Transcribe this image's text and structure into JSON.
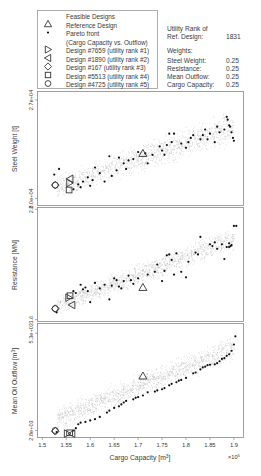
{
  "legend": {
    "items": [
      {
        "marker": "dot-gray",
        "label": "Feasible Designs"
      },
      {
        "marker": "triangle-up",
        "label": "Reference Design"
      },
      {
        "marker": "dot-black",
        "label": "Pareto front"
      },
      {
        "marker": "none",
        "label": "(Cargo Capacity vs. Outflow)"
      },
      {
        "marker": "triangle-right",
        "label": "Design #7659 (utility rank #1)"
      },
      {
        "marker": "triangle-left",
        "label": "Design #1890 (utility rank #2)"
      },
      {
        "marker": "diamond",
        "label": "Design #167 (utility rank #3)"
      },
      {
        "marker": "square",
        "label": "Design #5513 (utility rank #4)"
      },
      {
        "marker": "circle",
        "label": "Design #4725 (utility rank #5)"
      }
    ]
  },
  "info": {
    "utility_label_1": "Utility Rank of",
    "utility_label_2": "Ref. Design:",
    "utility_value": "1831",
    "weights_title": "Weights:",
    "weights": [
      {
        "name": "Steel Weight:",
        "value": "0.25"
      },
      {
        "name": "Resistance:",
        "value": "0.25"
      },
      {
        "name": "Mean Outflow:",
        "value": "0.25"
      },
      {
        "name": "Cargo Capacity:",
        "value": "0.25"
      }
    ]
  },
  "colors": {
    "feasible": "#9a9a9a",
    "pareto": "#111111",
    "frame": "#888888",
    "text": "#3a3a3a"
  },
  "chart_data": [
    {
      "type": "scatter",
      "title": "",
      "xlabel": "",
      "ylabel": "Steel Weight [t]",
      "yticks": [
        {
          "value": 20000,
          "label": "2.0e+04"
        },
        {
          "value": 27000,
          "label": "2.7e+04"
        }
      ],
      "xlim": [
        1.49,
        1.92
      ],
      "ylim": [
        19500,
        27600
      ],
      "band": {
        "x0": 1.53,
        "y0_lo": 19800,
        "y0_hi": 21800,
        "x1": 1.9,
        "y1_lo": 23600,
        "y1_hi": 26600
      },
      "reference": {
        "x": 1.71,
        "y": 23200
      },
      "designs": [
        {
          "id": 7659,
          "marker": "triangle-right",
          "x": 1.557,
          "y": 21100
        },
        {
          "id": 1890,
          "marker": "triangle-left",
          "x": 1.558,
          "y": 21400
        },
        {
          "id": 167,
          "marker": "diamond",
          "x": 1.527,
          "y": 20950
        },
        {
          "id": 5513,
          "marker": "square",
          "x": 1.556,
          "y": 20600
        },
        {
          "id": 4725,
          "marker": "circle",
          "x": 1.527,
          "y": 20950
        }
      ],
      "pareto": [
        [
          1.525,
          21700
        ],
        [
          1.535,
          22100
        ],
        [
          1.565,
          20650
        ],
        [
          1.575,
          21000
        ],
        [
          1.58,
          20800
        ],
        [
          1.585,
          21200
        ],
        [
          1.595,
          21500
        ],
        [
          1.6,
          20900
        ],
        [
          1.605,
          21300
        ],
        [
          1.61,
          22200
        ],
        [
          1.62,
          21800
        ],
        [
          1.63,
          21200
        ],
        [
          1.64,
          23000
        ],
        [
          1.645,
          21600
        ],
        [
          1.655,
          22000
        ],
        [
          1.66,
          22900
        ],
        [
          1.67,
          22500
        ],
        [
          1.675,
          22100
        ],
        [
          1.68,
          22700
        ],
        [
          1.69,
          22800
        ],
        [
          1.7,
          23300
        ],
        [
          1.715,
          23200
        ],
        [
          1.72,
          22500
        ],
        [
          1.73,
          23100
        ],
        [
          1.745,
          23700
        ],
        [
          1.75,
          23400
        ],
        [
          1.755,
          23100
        ],
        [
          1.76,
          23800
        ],
        [
          1.765,
          24600
        ],
        [
          1.77,
          24000
        ],
        [
          1.775,
          24600
        ],
        [
          1.79,
          23900
        ],
        [
          1.8,
          23600
        ],
        [
          1.805,
          24000
        ],
        [
          1.81,
          24300
        ],
        [
          1.815,
          24500
        ],
        [
          1.83,
          24200
        ],
        [
          1.835,
          24500
        ],
        [
          1.84,
          24900
        ],
        [
          1.845,
          24200
        ],
        [
          1.85,
          24600
        ],
        [
          1.86,
          24000
        ],
        [
          1.865,
          25100
        ],
        [
          1.87,
          24700
        ],
        [
          1.88,
          24900
        ],
        [
          1.885,
          25800
        ],
        [
          1.887,
          25600
        ],
        [
          1.89,
          25200
        ],
        [
          1.892,
          25100
        ],
        [
          1.895,
          24700
        ],
        [
          1.898,
          24300
        ],
        [
          1.9,
          24100
        ]
      ]
    },
    {
      "type": "scatter",
      "title": "",
      "xlabel": "",
      "ylabel": "Resistance [MN]",
      "yticks": [
        {
          "value": 1.6,
          "label": "1.6"
        },
        {
          "value": 2.8,
          "label": "2.8"
        }
      ],
      "xlim": [
        1.49,
        1.92
      ],
      "ylim": [
        1.58,
        2.82
      ],
      "band": {
        "x0": 1.53,
        "y0_lo": 1.62,
        "y0_hi": 1.88,
        "x1": 1.9,
        "y1_lo": 2.32,
        "y1_hi": 2.66
      },
      "reference": {
        "x": 1.71,
        "y": 1.95
      },
      "designs": [
        {
          "id": 7659,
          "marker": "triangle-right",
          "x": 1.555,
          "y": 1.84
        },
        {
          "id": 1890,
          "marker": "triangle-left",
          "x": 1.562,
          "y": 1.76
        },
        {
          "id": 167,
          "marker": "diamond",
          "x": 1.527,
          "y": 1.72
        },
        {
          "id": 5513,
          "marker": "square",
          "x": 1.558,
          "y": 1.86
        },
        {
          "id": 4725,
          "marker": "circle",
          "x": 1.527,
          "y": 1.72
        }
      ],
      "pareto": [
        [
          1.53,
          1.68
        ],
        [
          1.565,
          1.91
        ],
        [
          1.57,
          1.89
        ],
        [
          1.58,
          1.98
        ],
        [
          1.585,
          1.93
        ],
        [
          1.59,
          1.95
        ],
        [
          1.595,
          1.91
        ],
        [
          1.6,
          1.79
        ],
        [
          1.61,
          2.0
        ],
        [
          1.62,
          1.94
        ],
        [
          1.63,
          1.98
        ],
        [
          1.64,
          1.82
        ],
        [
          1.645,
          1.97
        ],
        [
          1.65,
          2.05
        ],
        [
          1.655,
          2.03
        ],
        [
          1.66,
          1.96
        ],
        [
          1.665,
          1.94
        ],
        [
          1.67,
          2.02
        ],
        [
          1.68,
          2.08
        ],
        [
          1.685,
          2.03
        ],
        [
          1.69,
          1.99
        ],
        [
          1.7,
          2.05
        ],
        [
          1.72,
          2.09
        ],
        [
          1.735,
          2.12
        ],
        [
          1.74,
          2.2
        ],
        [
          1.75,
          2.02
        ],
        [
          1.755,
          2.13
        ],
        [
          1.76,
          2.3
        ],
        [
          1.765,
          2.31
        ],
        [
          1.77,
          2.25
        ],
        [
          1.775,
          2.09
        ],
        [
          1.78,
          2.32
        ],
        [
          1.79,
          2.12
        ],
        [
          1.8,
          2.06
        ],
        [
          1.805,
          2.23
        ],
        [
          1.82,
          2.33
        ],
        [
          1.825,
          2.31
        ],
        [
          1.83,
          2.5
        ],
        [
          1.85,
          2.42
        ],
        [
          1.855,
          2.4
        ],
        [
          1.86,
          2.44
        ],
        [
          1.865,
          2.37
        ],
        [
          1.875,
          2.42
        ],
        [
          1.88,
          2.26
        ],
        [
          1.885,
          2.39
        ],
        [
          1.89,
          2.43
        ],
        [
          1.89,
          2.39
        ],
        [
          1.893,
          2.4
        ],
        [
          1.895,
          2.41
        ],
        [
          1.9,
          2.62
        ],
        [
          1.905,
          2.62
        ]
      ]
    },
    {
      "type": "scatter",
      "title": "",
      "xlabel": "Cargo Capacity [m^3]",
      "x_multiplier": "×10^5",
      "ylabel": "Mean Oil Outflow [m^3]",
      "xticks": [
        1.5,
        1.55,
        1.6,
        1.65,
        1.7,
        1.75,
        1.8,
        1.85,
        1.9
      ],
      "yticks": [
        {
          "value": 2800,
          "label": "2.8e+03"
        },
        {
          "value": 5300,
          "label": "5.3e+03"
        }
      ],
      "xlim": [
        1.49,
        1.92
      ],
      "ylim": [
        2620,
        5550
      ],
      "band": {
        "x0": 1.53,
        "y0_lo": 2750,
        "y0_hi": 3450,
        "x1": 1.9,
        "y1_lo": 4500,
        "y1_hi": 5350
      },
      "reference": {
        "x": 1.71,
        "y": 4200
      },
      "designs": [
        {
          "id": 7659,
          "marker": "triangle-right",
          "x": 1.552,
          "y": 2720
        },
        {
          "id": 1890,
          "marker": "triangle-left",
          "x": 1.562,
          "y": 2720
        },
        {
          "id": 167,
          "marker": "diamond",
          "x": 1.527,
          "y": 2780
        },
        {
          "id": 5513,
          "marker": "square",
          "x": 1.557,
          "y": 2740
        },
        {
          "id": 4725,
          "marker": "circle",
          "x": 1.527,
          "y": 2800
        }
      ],
      "pareto": [
        [
          1.53,
          2760
        ],
        [
          1.565,
          2800
        ],
        [
          1.57,
          2860
        ],
        [
          1.575,
          2960
        ],
        [
          1.58,
          3000
        ],
        [
          1.59,
          3020
        ],
        [
          1.6,
          3060
        ],
        [
          1.61,
          3090
        ],
        [
          1.62,
          3150
        ],
        [
          1.635,
          3260
        ],
        [
          1.64,
          3310
        ],
        [
          1.65,
          3380
        ],
        [
          1.66,
          3420
        ],
        [
          1.665,
          3470
        ],
        [
          1.67,
          3520
        ],
        [
          1.675,
          3560
        ],
        [
          1.69,
          3600
        ],
        [
          1.695,
          3640
        ],
        [
          1.7,
          3660
        ],
        [
          1.71,
          3700
        ],
        [
          1.72,
          3780
        ],
        [
          1.735,
          3800
        ],
        [
          1.74,
          3830
        ],
        [
          1.75,
          3860
        ],
        [
          1.755,
          3890
        ],
        [
          1.765,
          3960
        ],
        [
          1.77,
          4000
        ],
        [
          1.78,
          4040
        ],
        [
          1.785,
          4080
        ],
        [
          1.79,
          4100
        ],
        [
          1.8,
          4150
        ],
        [
          1.815,
          4270
        ],
        [
          1.82,
          4290
        ],
        [
          1.83,
          4370
        ],
        [
          1.835,
          4420
        ],
        [
          1.84,
          4440
        ],
        [
          1.845,
          4480
        ],
        [
          1.85,
          4490
        ],
        [
          1.86,
          4500
        ],
        [
          1.865,
          4530
        ],
        [
          1.87,
          4580
        ],
        [
          1.875,
          4640
        ],
        [
          1.88,
          4660
        ],
        [
          1.885,
          4720
        ],
        [
          1.89,
          4760
        ],
        [
          1.895,
          4850
        ],
        [
          1.9,
          5010
        ],
        [
          1.903,
          5220
        ]
      ]
    }
  ]
}
